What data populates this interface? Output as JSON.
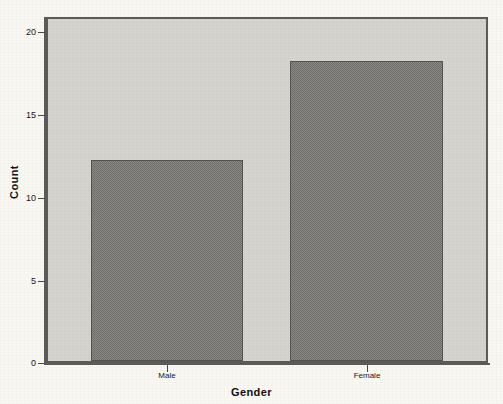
{
  "chart_data": {
    "type": "bar",
    "title": "",
    "subtitle": "",
    "categories": [
      "Male",
      "Female"
    ],
    "values": [
      12,
      18
    ],
    "series": [
      {
        "name": "Count",
        "values": [
          12,
          18
        ]
      }
    ],
    "xlabel": "Gender",
    "ylabel": "Count",
    "ylim": [
      0,
      20
    ],
    "y_ticks": [
      0,
      5,
      10,
      15,
      20
    ],
    "y_tick_labels": [
      "0",
      "5",
      "10",
      "15",
      "20"
    ],
    "x_tick_labels": [
      "Male",
      "Female"
    ],
    "grid": false,
    "legend": false,
    "legend_position": "none",
    "bar_fill_style": "checkerboard-dither-gray",
    "colors": {
      "page_background": "#faf8f2",
      "plot_background": "#d6d4d0",
      "bar_fill": "#8e8c88",
      "bar_pattern": "#6e6c68",
      "bar_border": "#55534f",
      "axis_line": "#5d5b58",
      "text": "#101010"
    }
  },
  "axes": {
    "y": {
      "title": "Count",
      "ticks": [
        {
          "label": "20",
          "value": 20
        },
        {
          "label": "15",
          "value": 15
        },
        {
          "label": "10",
          "value": 10
        },
        {
          "label": "5",
          "value": 5
        },
        {
          "label": "0",
          "value": 0
        }
      ]
    },
    "x": {
      "title": "Gender",
      "ticks": [
        {
          "label": "Male"
        },
        {
          "label": "Female"
        }
      ]
    }
  },
  "bars": [
    {
      "category": "Male",
      "value": 12
    },
    {
      "category": "Female",
      "value": 18
    }
  ]
}
